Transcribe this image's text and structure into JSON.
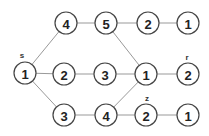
{
  "nodes": [
    {
      "id": "s",
      "value": "1",
      "x": 25,
      "y": 73,
      "label": "s"
    },
    {
      "id": "t1",
      "value": "4",
      "x": 66,
      "y": 23
    },
    {
      "id": "t2",
      "value": "5",
      "x": 106,
      "y": 23
    },
    {
      "id": "t3",
      "value": "2",
      "x": 148,
      "y": 23
    },
    {
      "id": "t4",
      "value": "1",
      "x": 188,
      "y": 23
    },
    {
      "id": "m1",
      "value": "2",
      "x": 64,
      "y": 74
    },
    {
      "id": "m2",
      "value": "3",
      "x": 105,
      "y": 74
    },
    {
      "id": "m3",
      "value": "1",
      "x": 146,
      "y": 74
    },
    {
      "id": "r",
      "value": "2",
      "x": 188,
      "y": 74,
      "label": "r"
    },
    {
      "id": "b1",
      "value": "3",
      "x": 64,
      "y": 115
    },
    {
      "id": "b2",
      "value": "4",
      "x": 106,
      "y": 115
    },
    {
      "id": "z",
      "value": "2",
      "x": 146,
      "y": 115,
      "label": "z"
    },
    {
      "id": "b4",
      "value": "1",
      "x": 188,
      "y": 115
    }
  ],
  "labels": {
    "s": "s",
    "r": "r",
    "z": "z"
  }
}
